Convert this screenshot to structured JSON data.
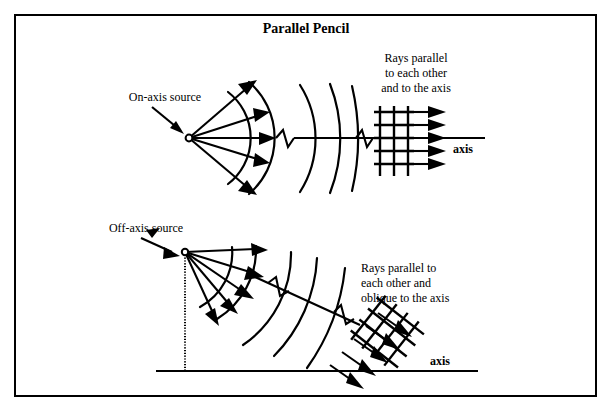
{
  "figure": {
    "title": "Parallel Pencil",
    "border_color": "#000000",
    "ink_color": "#000000",
    "background_color": "#ffffff"
  },
  "top_panel": {
    "source_label": "On-axis source",
    "source_marker": "point-source-circle",
    "rays_note_line1": "Rays parallel",
    "rays_note_line2": "to each other",
    "rays_note_line3": "and to the axis",
    "axis_label": "axis",
    "ray_count": 5,
    "wavefront_arc_count": 5,
    "output_arrow_count": 5,
    "grid_vertical_lines": 3,
    "grid_horizontal_lines": 6,
    "break_symbol": "zigzag"
  },
  "bottom_panel": {
    "source_label": "Off-axis source",
    "source_marker": "point-source-dot",
    "rays_note_line1": "Rays parallel  to",
    "rays_note_line2": "each other and",
    "rays_note_line3": "oblique to the axis",
    "axis_label": "axis",
    "ray_count": 5,
    "wavefront_arc_count": 5,
    "output_arrow_count": 5,
    "grid_vertical_lines": 4,
    "grid_horizontal_lines": 5,
    "break_symbol": "zigzag",
    "drop_line_style": "dotted"
  }
}
